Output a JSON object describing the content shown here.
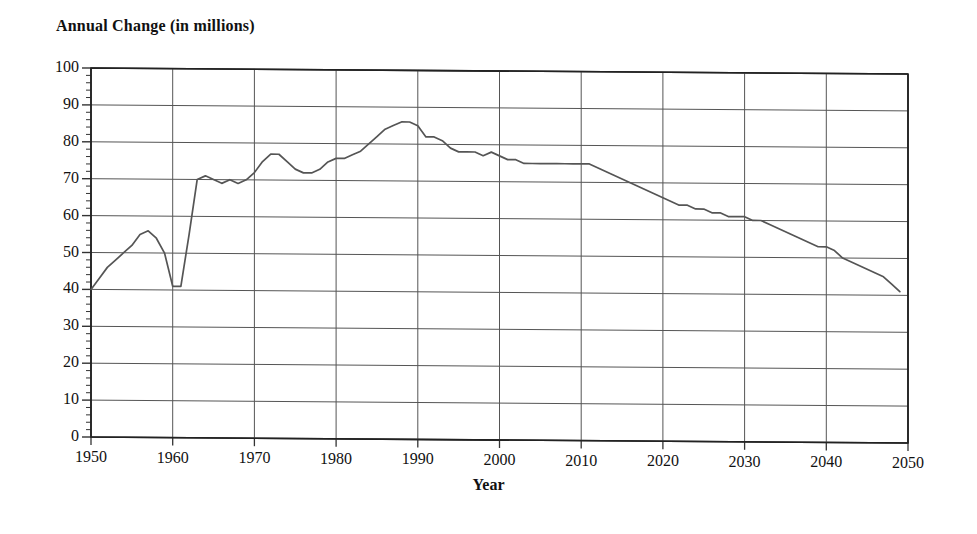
{
  "chart_data": {
    "type": "line",
    "title": "Annual Change (in millions)",
    "xlabel": "Year",
    "ylabel": "Annual Change (in millions)",
    "xlim": [
      1950,
      2050
    ],
    "ylim": [
      0,
      100
    ],
    "grid": true,
    "legend": null,
    "x_ticks": [
      "1950",
      "1960",
      "1970",
      "1980",
      "1990",
      "2000",
      "2010",
      "2020",
      "2030",
      "2040",
      "2050"
    ],
    "y_ticks": [
      "0",
      "10",
      "20",
      "30",
      "40",
      "50",
      "60",
      "70",
      "80",
      "90",
      "100"
    ],
    "minor_ticks_y": true,
    "line_color": "#555555",
    "series": [
      {
        "name": "Annual Change",
        "x": [
          1950,
          1951,
          1952,
          1953,
          1954,
          1955,
          1956,
          1957,
          1958,
          1959,
          1960,
          1961,
          1962,
          1963,
          1964,
          1965,
          1966,
          1967,
          1968,
          1969,
          1970,
          1971,
          1972,
          1973,
          1974,
          1975,
          1976,
          1977,
          1978,
          1979,
          1980,
          1981,
          1982,
          1983,
          1984,
          1985,
          1986,
          1987,
          1988,
          1989,
          1990,
          1991,
          1992,
          1993,
          1994,
          1995,
          1996,
          1997,
          1998,
          1999,
          2000,
          2001,
          2002,
          2003,
          2004,
          2005,
          2006,
          2007,
          2008,
          2009,
          2010,
          2011,
          2012,
          2013,
          2014,
          2015,
          2016,
          2017,
          2018,
          2019,
          2020,
          2021,
          2022,
          2023,
          2024,
          2025,
          2026,
          2027,
          2028,
          2029,
          2030,
          2031,
          2032,
          2033,
          2034,
          2035,
          2036,
          2037,
          2038,
          2039,
          2040,
          2041,
          2042,
          2043,
          2044,
          2045,
          2046,
          2047,
          2048,
          2049
        ],
        "y": [
          40,
          43,
          46,
          48,
          50,
          52,
          55,
          56,
          54,
          50,
          41,
          41,
          55,
          70,
          71,
          70,
          69,
          70,
          69,
          70,
          72,
          75,
          77,
          77,
          75,
          73,
          72,
          72,
          73,
          75,
          76,
          76,
          77,
          78,
          80,
          82,
          84,
          85,
          86,
          86,
          85,
          82,
          82,
          81,
          79,
          78,
          78,
          78,
          77,
          78,
          77,
          76,
          76,
          75,
          75,
          75,
          75,
          75,
          75,
          75,
          75,
          75,
          74,
          73,
          72,
          71,
          70,
          69,
          68,
          67,
          66,
          65,
          64,
          64,
          63,
          63,
          62,
          62,
          61,
          61,
          61,
          60,
          60,
          59,
          58,
          57,
          56,
          55,
          54,
          53,
          53,
          52,
          50,
          49,
          48,
          47,
          46,
          45,
          43,
          41
        ]
      }
    ]
  },
  "axis_titles": {
    "x": "Year",
    "y": "Annual Change (in millions)"
  }
}
